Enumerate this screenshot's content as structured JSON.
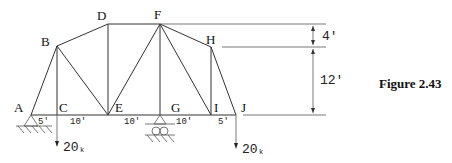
{
  "figure": {
    "caption": "Figure 2.43",
    "nodes": [
      {
        "id": "A",
        "label": "A"
      },
      {
        "id": "B",
        "label": "B"
      },
      {
        "id": "C",
        "label": "C"
      },
      {
        "id": "D",
        "label": "D"
      },
      {
        "id": "E",
        "label": "E"
      },
      {
        "id": "F",
        "label": "F"
      },
      {
        "id": "G",
        "label": "G"
      },
      {
        "id": "H",
        "label": "H"
      },
      {
        "id": "I",
        "label": "I"
      },
      {
        "id": "J",
        "label": "J"
      }
    ],
    "spans": [
      "5'",
      "10'",
      "10'",
      "10'",
      "5'"
    ],
    "heights": [
      "4'",
      "12'"
    ],
    "loads": [
      {
        "at": "C",
        "value": "20",
        "unit": "k"
      },
      {
        "at": "J",
        "value": "20",
        "unit": "k"
      }
    ],
    "supports": [
      {
        "at": "A",
        "type": "pin"
      },
      {
        "at": "G",
        "type": "roller"
      }
    ]
  }
}
